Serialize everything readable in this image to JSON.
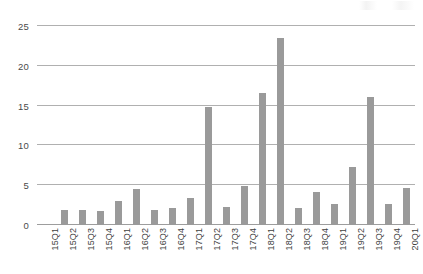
{
  "chart_data": {
    "type": "bar",
    "title": "",
    "subtitle": "",
    "xlabel": "",
    "ylabel": "",
    "ylim": [
      0,
      25
    ],
    "yticks": [
      0,
      5,
      10,
      15,
      20,
      25
    ],
    "ytick_labels": [
      "0",
      "5",
      "10",
      "15",
      "20",
      "25"
    ],
    "grid": true,
    "legend": false,
    "legend_position": "none",
    "bar_color": "#9a9a9a",
    "gridline_color": "#b0b0b0",
    "axis_color": "#9d9d9d",
    "categories": [
      "15Q1",
      "15Q2",
      "15Q3",
      "15Q4",
      "16Q1",
      "16Q2",
      "16Q3",
      "16Q4",
      "17Q1",
      "17Q2",
      "17Q3",
      "17Q4",
      "18Q1",
      "18Q2",
      "18Q3",
      "18Q4",
      "19Q1",
      "19Q2",
      "19Q3",
      "19Q4",
      "20Q1"
    ],
    "values": [
      0,
      1.9,
      1.9,
      1.8,
      3.0,
      4.5,
      1.9,
      2.1,
      3.4,
      14.8,
      2.3,
      4.9,
      16.6,
      23.5,
      2.1,
      4.2,
      2.6,
      7.3,
      16.1,
      2.7,
      4.7
    ]
  }
}
